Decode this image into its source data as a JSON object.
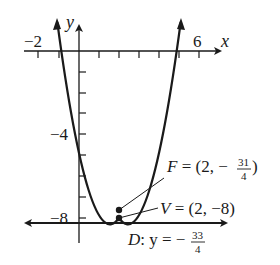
{
  "figure": {
    "type": "parabola-graph",
    "equation_implied": "(x-2)^2 = y+8",
    "axes": {
      "x_label": "x",
      "y_label": "y",
      "x_tick_labels": [
        {
          "value": -2,
          "text": "−2"
        },
        {
          "value": 6,
          "text": "6"
        }
      ],
      "y_tick_labels": [
        {
          "value": -4,
          "text": "−4"
        },
        {
          "value": -8,
          "text": "−8"
        }
      ],
      "x_range": [
        -2,
        6
      ],
      "y_range": [
        -8,
        0
      ]
    },
    "annotations": {
      "focus": {
        "name": "F",
        "eq": " = (2, −",
        "frac_num": "31",
        "frac_den": "4",
        "close": ")",
        "point": [
          2,
          -7.75
        ]
      },
      "vertex": {
        "name": "V",
        "text": " = (2, −8)",
        "point": [
          2,
          -8
        ]
      },
      "directrix": {
        "name": "D",
        "text": ": y = −",
        "frac_num": "33",
        "frac_den": "4",
        "y": -8.25
      }
    },
    "colors": {
      "stroke": "#1a1a1a",
      "background": "#ffffff"
    }
  }
}
